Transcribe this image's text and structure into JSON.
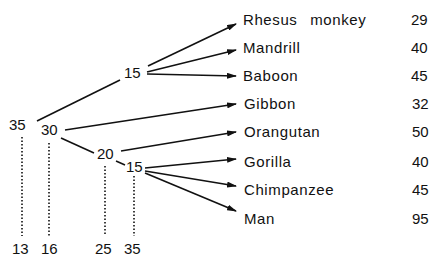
{
  "diagram": {
    "type": "phylogenetic-tree",
    "nodes": [
      {
        "id": "root",
        "value": "35"
      },
      {
        "id": "n30",
        "value": "30"
      },
      {
        "id": "n15_monkeys",
        "value": "15"
      },
      {
        "id": "n20",
        "value": "20"
      },
      {
        "id": "n15_apes",
        "value": "15"
      }
    ],
    "bottom_values": [
      "13",
      "16",
      "25",
      "35"
    ],
    "leaves": [
      {
        "name": "Rhesus  monkey",
        "value": "29"
      },
      {
        "name": "Mandrill",
        "value": "40"
      },
      {
        "name": "Baboon",
        "value": "45"
      },
      {
        "name": "Gibbon",
        "value": "32"
      },
      {
        "name": "Orangutan",
        "value": "50"
      },
      {
        "name": "Gorilla",
        "value": "40"
      },
      {
        "name": "Chimpanzee",
        "value": "45"
      },
      {
        "name": "Man",
        "value": "95"
      }
    ]
  }
}
